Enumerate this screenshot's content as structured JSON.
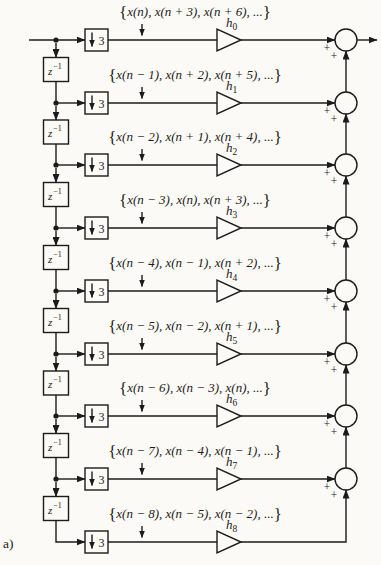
{
  "figure": {
    "panel_label": "a)"
  },
  "symbols": {
    "lbrace": "{",
    "rbrace": "}",
    "plus": "+",
    "delay_base": "z",
    "delay_exp": "−1",
    "downsample_factor": "3",
    "gain_base": "h",
    "ellipsis": "..."
  },
  "rows": [
    {
      "sequence": "x(n), x(n + 3), x(n + 6), ...",
      "gain_sub": "0",
      "has_adder": true
    },
    {
      "sequence": "x(n − 1), x(n + 2), x(n + 5), ...",
      "gain_sub": "1",
      "has_adder": true
    },
    {
      "sequence": "x(n − 2), x(n + 1), x(n + 4), ...",
      "gain_sub": "2",
      "has_adder": true
    },
    {
      "sequence": "x(n − 3), x(n), x(n + 3), ...",
      "gain_sub": "3",
      "has_adder": true
    },
    {
      "sequence": "x(n − 4), x(n − 1), x(n + 2), ...",
      "gain_sub": "4",
      "has_adder": true
    },
    {
      "sequence": "x(n − 5), x(n − 2), x(n + 1), ...",
      "gain_sub": "5",
      "has_adder": true
    },
    {
      "sequence": "x(n − 6), x(n − 3), x(n), ...",
      "gain_sub": "6",
      "has_adder": true
    },
    {
      "sequence": "x(n − 7), x(n − 4), x(n − 1), ...",
      "gain_sub": "7",
      "has_adder": true
    },
    {
      "sequence": "x(n − 8), x(n − 5), x(n − 2), ...",
      "gain_sub": "8",
      "has_adder": false
    }
  ],
  "colors": {
    "ink": "#1b1b1b",
    "paper": "#fbfaf6"
  }
}
